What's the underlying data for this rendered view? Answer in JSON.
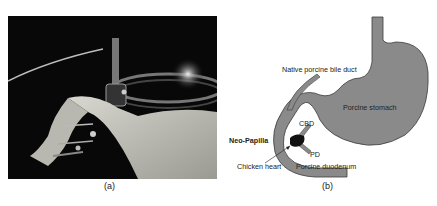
{
  "figure": {
    "panel_a": {
      "caption": "(a)",
      "description": "Photograph of ex-vivo porcine stomach and duodenum model with endoscope"
    },
    "panel_b": {
      "caption": "(b)",
      "labels": {
        "bile_duct": "Native porcine bile duct",
        "stomach": "Porcine stomach",
        "cbd": "CBD",
        "neo_papilla": "Neo-Papilla",
        "pd": "PD",
        "chicken_heart": "Chicken heart",
        "duodenum": "Porcine duodenum"
      }
    },
    "colors": {
      "organ_fill": "#8a8a8a",
      "organ_stroke": "#3a3a3a",
      "heart_fill": "#111111"
    }
  }
}
